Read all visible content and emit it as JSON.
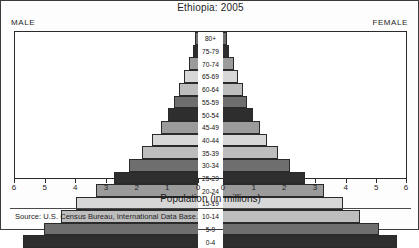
{
  "chart": {
    "title": "Ethiopia: 2005",
    "male_label": "MALE",
    "female_label": "FEMALE",
    "xlabel": "Population (in millions)",
    "source": "Source:  U.S. Census Bureau, International Data Base."
  },
  "chart_data": {
    "type": "bar",
    "orientation": "horizontal",
    "subtype": "population-pyramid",
    "title": "Ethiopia: 2005",
    "xlabel": "Population (in millions)",
    "ylabel": "",
    "grid": false,
    "legend": false,
    "xlim": [
      -6,
      6
    ],
    "xticks_left": [
      6,
      5,
      4,
      3,
      2,
      1,
      0
    ],
    "xticks_right": [
      0,
      1,
      2,
      3,
      4,
      5,
      6
    ],
    "categories": [
      "80+",
      "75-79",
      "70-74",
      "65-69",
      "60-64",
      "55-59",
      "50-54",
      "45-49",
      "40-44",
      "35-39",
      "30-34",
      "25-29",
      "20-24",
      "15-19",
      "10-14",
      "5-9",
      "0-4"
    ],
    "series": [
      {
        "name": "MALE",
        "side": "left",
        "values": [
          0.1,
          0.18,
          0.3,
          0.45,
          0.62,
          0.8,
          1.0,
          1.2,
          1.5,
          1.85,
          2.25,
          2.75,
          3.35,
          4.0,
          4.5,
          5.05,
          5.75
        ]
      },
      {
        "name": "FEMALE",
        "side": "right",
        "values": [
          0.12,
          0.2,
          0.35,
          0.5,
          0.65,
          0.8,
          1.0,
          1.2,
          1.45,
          1.8,
          2.2,
          2.7,
          3.3,
          3.95,
          4.5,
          5.1,
          5.7
        ]
      }
    ],
    "shades": [
      "s0",
      "s1",
      "s2",
      "s3",
      "s4",
      "s0",
      "s1",
      "s2",
      "s3",
      "s4",
      "s0",
      "s1",
      "s2",
      "s3",
      "s4",
      "s0",
      "s1"
    ]
  }
}
